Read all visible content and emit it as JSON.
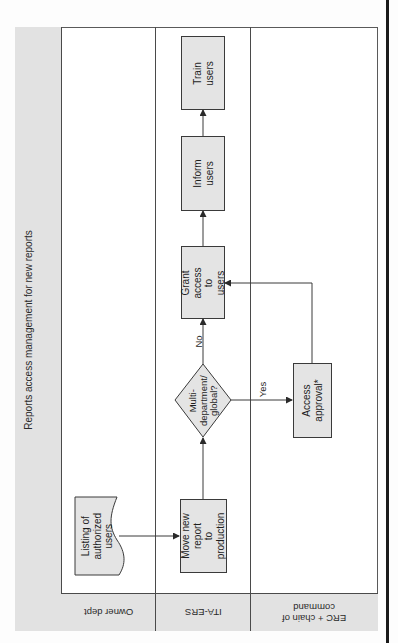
{
  "diagram": {
    "title": "Reports access management for new reports",
    "lanes": [
      {
        "id": "owner",
        "label": "Owner dept"
      },
      {
        "id": "itaers",
        "label": "ITA-ERS"
      },
      {
        "id": "erc",
        "label": "ERC + chain of\ncommand"
      }
    ],
    "nodes": {
      "listing": {
        "type": "document",
        "lane": "owner",
        "label": "Listing of\nauthorized\nusers"
      },
      "move": {
        "type": "process",
        "lane": "itaers",
        "label": "Move new report\nto production"
      },
      "decision": {
        "type": "decision",
        "lane": "itaers",
        "label": "Multi-\ndepartment/\nglobal?"
      },
      "grant": {
        "type": "process",
        "lane": "itaers",
        "label": "Grant access to\nusers"
      },
      "inform": {
        "type": "process",
        "lane": "itaers",
        "label": "Inform users"
      },
      "train": {
        "type": "process",
        "lane": "itaers",
        "label": "Train users"
      },
      "approval": {
        "type": "process",
        "lane": "erc",
        "label": "Access approval*"
      }
    },
    "edges": [
      {
        "from": "listing",
        "to": "move",
        "label": ""
      },
      {
        "from": "move",
        "to": "decision",
        "label": ""
      },
      {
        "from": "decision",
        "to": "grant",
        "label": "No"
      },
      {
        "from": "decision",
        "to": "approval",
        "label": "Yes"
      },
      {
        "from": "approval",
        "to": "grant",
        "label": ""
      },
      {
        "from": "grant",
        "to": "inform",
        "label": ""
      },
      {
        "from": "inform",
        "to": "train",
        "label": ""
      }
    ],
    "colors": {
      "fill": "#e4e4e4",
      "stroke": "#3a3a3a",
      "header": "#e2e2e2"
    }
  }
}
